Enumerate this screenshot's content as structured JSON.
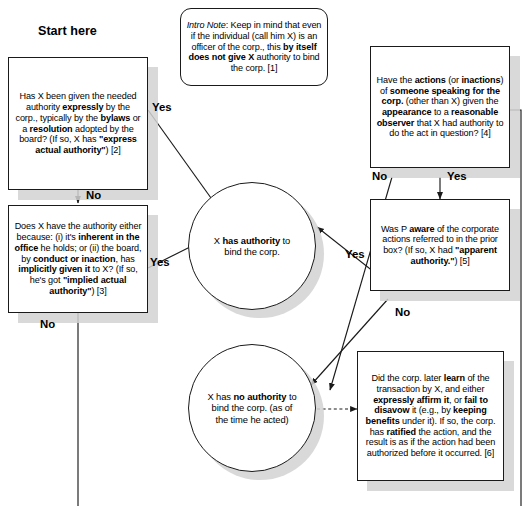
{
  "diagram": {
    "heading": "Start here",
    "colors": {
      "stroke": "#1a1a1a",
      "fill": "#ffffff",
      "shadow": "#d2d2d2",
      "text": "#000000"
    }
  },
  "nodes": {
    "intro_note": {
      "id": "1",
      "shape": "rounded-rect",
      "text": "Intro Note: Keep in mind that even if the individual (call him X) is an officer of the corp., this by itself does not give X authority to bind the corp. [1]"
    },
    "box_express": {
      "id": "2",
      "shape": "rect",
      "text": "Has X been given the needed authority expressly by the corp., typically by the bylaws or a resolution adopted by the board? (If so, X has \"express actual authority\") [2]"
    },
    "box_implied": {
      "id": "3",
      "shape": "rect",
      "text": "Does X have the authority either because: (i) it's inherent in the office he holds; or (ii) the board, by conduct or inaction, has implicitly given it to X? (If so, he's got \"implied actual authority\") [3]"
    },
    "box_apparent_actions": {
      "id": "4",
      "shape": "rect",
      "text": "Have the actions (or inactions) of someone speaking for the corp. (other than X) given the appearance to a reasonable observer that X had authority to do the act in question? [4]"
    },
    "box_aware": {
      "id": "5",
      "shape": "rect",
      "text": "Was P aware of the corporate actions referred to in the prior box? (If so, X had \"apparent authority.\") [5]"
    },
    "box_ratified": {
      "id": "6",
      "shape": "rect",
      "text": "Did the corp. later learn of the transaction by X, and either expressly affirm it, or fail to disavow it (e.g., by keeping benefits under it). If so, the corp. has ratified the action, and the result is as if the action had been authorized before it occurred. [6]"
    },
    "circle_authority": {
      "shape": "circle",
      "text": "X has authority to bind the corp."
    },
    "circle_no_authority": {
      "shape": "circle",
      "text": "X has no authority to bind the corp. (as of the time he acted)"
    }
  },
  "edges": [
    {
      "from": "box_express",
      "to": "circle_authority",
      "label": "Yes"
    },
    {
      "from": "box_express",
      "to": "box_implied",
      "label": "No"
    },
    {
      "from": "box_implied",
      "to": "circle_authority",
      "label": "Yes"
    },
    {
      "from": "box_implied",
      "to": "continues-below",
      "label": "No"
    },
    {
      "from": "box_apparent_actions",
      "to": "circle_no_authority",
      "label": "No"
    },
    {
      "from": "box_apparent_actions",
      "to": "box_aware",
      "label": "Yes"
    },
    {
      "from": "box_aware",
      "to": "circle_authority",
      "label": "Yes"
    },
    {
      "from": "box_aware",
      "to": "circle_no_authority",
      "label": "No"
    },
    {
      "from": "circle_no_authority",
      "to": "box_ratified",
      "label": "",
      "style": "dashed"
    }
  ],
  "edge_labels": {
    "yes_express": "Yes",
    "no_express": "No",
    "yes_implied": "Yes",
    "no_implied": "No",
    "no_actions": "No",
    "yes_actions": "Yes",
    "yes_aware": "Yes",
    "no_aware": "No"
  }
}
